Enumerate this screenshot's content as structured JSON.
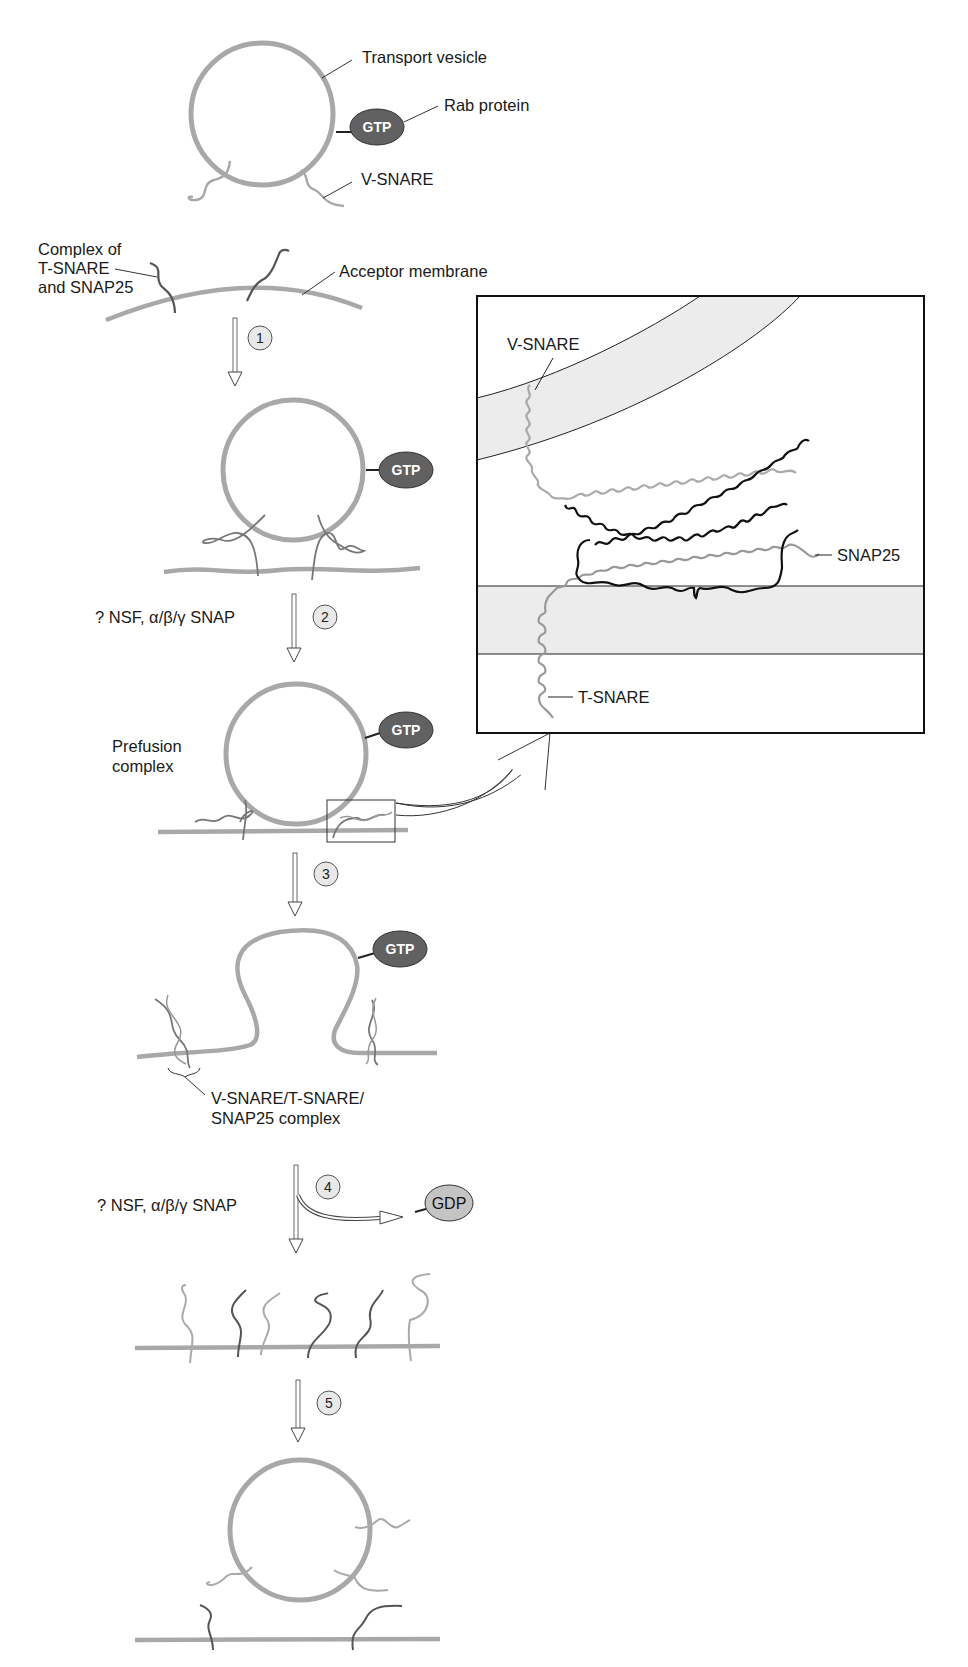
{
  "diagram": {
    "type": "biological-pathway",
    "colors": {
      "membrane": "#a8a8a8",
      "t_snare": "#555555",
      "v_snare": "#a8a8a8",
      "gtp_fill": "#616161",
      "gdp_fill": "#c4c4c4",
      "step_circle_fill": "#e8e8e8",
      "bilayer_fill": "#ececec",
      "snap25": "#111111"
    },
    "labels": {
      "transport_vesicle": "Transport vesicle",
      "rab_protein": "Rab protein",
      "v_snare": "V-SNARE",
      "complex_line1": "Complex of",
      "complex_line2": "T-SNARE",
      "complex_line3": "and SNAP25",
      "acceptor_membrane": "Acceptor membrane",
      "nsf_snap_step2": "? NSF, α/β/γ SNAP",
      "prefusion_line1": "Prefusion",
      "prefusion_line2": "complex",
      "snare_complex_line1": "V-SNARE/T-SNARE/",
      "snare_complex_line2": "SNAP25 complex",
      "nsf_snap_step4": "? NSF, α/β/γ SNAP"
    },
    "badges": {
      "gtp": "GTP",
      "gdp": "GDP"
    },
    "steps": [
      "1",
      "2",
      "3",
      "4",
      "5"
    ],
    "inset": {
      "v_snare": "V-SNARE",
      "snap25": "SNAP25",
      "t_snare": "T-SNARE"
    }
  }
}
